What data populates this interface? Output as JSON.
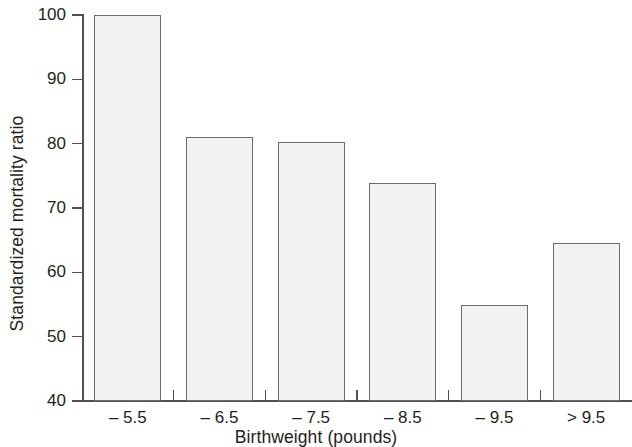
{
  "chart_data": {
    "type": "bar",
    "title": "",
    "xlabel": "Birthweight (pounds)",
    "ylabel": "Standardized mortality ratio",
    "categories": [
      "– 5.5",
      "– 6.5",
      "– 7.5",
      "– 8.5",
      "– 9.5",
      "> 9.5"
    ],
    "values": [
      100,
      81,
      80.3,
      73.9,
      55,
      64.6
    ],
    "ylim": [
      40,
      100
    ],
    "yticks": [
      40,
      50,
      60,
      70,
      80,
      90,
      100
    ],
    "ytick_labels": [
      "40",
      "50",
      "60",
      "70",
      "80",
      "90",
      "100"
    ],
    "grid": false,
    "legend": null,
    "bar_fill_color": "#f2f2f1",
    "bar_edge_color": "#6d6a69",
    "axis_color": "#53504f",
    "background_color": "#ffffff"
  }
}
